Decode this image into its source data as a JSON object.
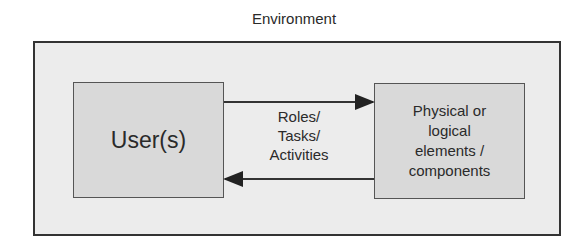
{
  "diagram": {
    "environment_label": "Environment",
    "nodes": {
      "user": "User(s)",
      "components": "Physical or\nlogical\nelements /\ncomponents"
    },
    "edge_label": "Roles/\nTasks/\nActivities",
    "colors": {
      "environment_fill": "#ececec",
      "node_fill": "#d9d9d9",
      "border": "#333333"
    }
  }
}
